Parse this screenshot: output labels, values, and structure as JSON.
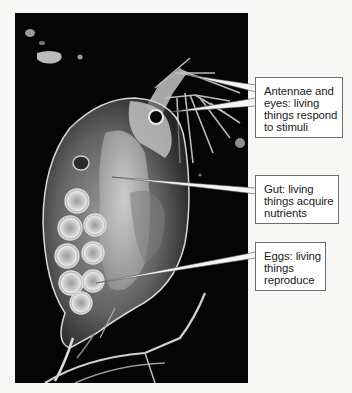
{
  "figure": {
    "background_color": "#050505",
    "callouts": [
      {
        "id": "antennae",
        "lines": [
          "Antennae and",
          "eyes: living",
          "things respond",
          "to stimuli"
        ],
        "text": "Antennae and eyes: living things respond to stimuli",
        "pointer_targets": [
          "antennae",
          "eye"
        ]
      },
      {
        "id": "gut",
        "lines": [
          "Gut: living",
          "things acquire",
          "nutrients"
        ],
        "text": "Gut: living things acquire nutrients",
        "pointer_targets": [
          "gut"
        ]
      },
      {
        "id": "eggs",
        "lines": [
          "Eggs: living",
          "things",
          "reproduce"
        ],
        "text": "Eggs: living things reproduce",
        "pointer_targets": [
          "eggs"
        ]
      }
    ],
    "colors": {
      "callout_border": "#6d6d6d",
      "callout_fill": "#ffffff",
      "pointer_fill": "#f4f4f4",
      "text": "#1a1a1a"
    }
  }
}
